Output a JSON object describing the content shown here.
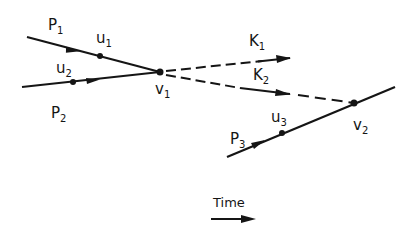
{
  "diagram": {
    "colors": {
      "line": "#151515",
      "background": "#ffffff"
    },
    "nodes": [
      {
        "id": "v1",
        "label": "v",
        "sub": "1",
        "x": 160,
        "y": 72
      },
      {
        "id": "v2",
        "label": "v",
        "sub": "2",
        "x": 354,
        "y": 103
      }
    ],
    "points": [
      {
        "id": "u1",
        "label": "u",
        "sub": "1",
        "x": 100,
        "y": 56
      },
      {
        "id": "u2",
        "label": "u",
        "sub": "2",
        "x": 73,
        "y": 82
      },
      {
        "id": "u3",
        "label": "u",
        "sub": "3",
        "x": 282,
        "y": 133
      }
    ],
    "particles": [
      {
        "id": "P1",
        "label": "P",
        "sub": "1",
        "style": "solid"
      },
      {
        "id": "P2",
        "label": "P",
        "sub": "2",
        "style": "solid"
      },
      {
        "id": "P3",
        "label": "P",
        "sub": "3",
        "style": "solid"
      },
      {
        "id": "K1",
        "label": "K",
        "sub": "1",
        "style": "dashed"
      },
      {
        "id": "K2",
        "label": "K",
        "sub": "2",
        "style": "dashed"
      }
    ],
    "labels": {
      "P1": {
        "main": "P",
        "sub": "1"
      },
      "P2": {
        "main": "P",
        "sub": "2"
      },
      "P3": {
        "main": "P",
        "sub": "3"
      },
      "K1": {
        "main": "K",
        "sub": "1"
      },
      "K2": {
        "main": "K",
        "sub": "2"
      },
      "u1": {
        "main": "u",
        "sub": "1"
      },
      "u2": {
        "main": "u",
        "sub": "2"
      },
      "u3": {
        "main": "u",
        "sub": "3"
      },
      "v1": {
        "main": "v",
        "sub": "1"
      },
      "v2": {
        "main": "v",
        "sub": "2"
      }
    },
    "time_axis": {
      "label": "Time"
    }
  }
}
